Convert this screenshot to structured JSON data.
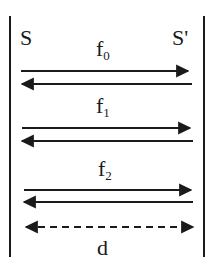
{
  "diagram": {
    "left_label": "S",
    "right_label": "S'",
    "rows": [
      {
        "label": "f",
        "subscript": "0"
      },
      {
        "label": "f",
        "subscript": "1"
      },
      {
        "label": "f",
        "subscript": "2"
      }
    ],
    "distance_label": "d",
    "colors": {
      "ink": "#1a1a1a",
      "background": "#ffffff"
    }
  }
}
